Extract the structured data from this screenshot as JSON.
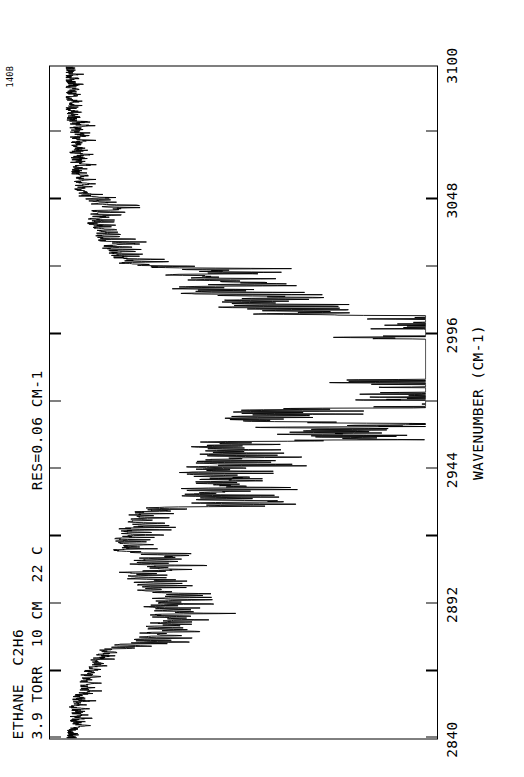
{
  "figure": {
    "corner_code": "140B",
    "header_line1": "ETHANE  C2H6",
    "header_line2": "3.9 TORR  10 CM  22 C      RES=0.06 CM-1"
  },
  "axis": {
    "title": "WAVENUMBER (CM-1)",
    "tick_labels": [
      "2840",
      "2892",
      "2944",
      "2996",
      "3048",
      "3100"
    ],
    "minor_ticks_per_interval": 1
  },
  "chart_data": {
    "type": "line",
    "title": "ETHANE  C2H6",
    "subtitle": "3.9 TORR  10 CM  22 C      RES=0.06 CM-1",
    "plate_code": "140B",
    "xlabel": "WAVENUMBER (CM-1)",
    "ylabel": "TRANSMITTANCE",
    "xlim": [
      2840,
      3100
    ],
    "ylim": [
      0,
      1
    ],
    "xticks": [
      2840,
      2892,
      2944,
      2996,
      3048,
      3100
    ],
    "grid": false,
    "legend": false,
    "orientation": "rotated-90-ccw",
    "bands": [
      {
        "center": 2896,
        "label": "nu8 / nu5 region",
        "depth": 0.42
      },
      {
        "center": 2954,
        "label": "nu7 P-branch",
        "depth": 0.55
      },
      {
        "center": 2985,
        "label": "nu7 Q-branch",
        "depth": 0.92
      },
      {
        "center": 3000,
        "label": "nu7 R-branch",
        "depth": 0.8
      },
      {
        "center": 3030,
        "label": "band tail",
        "depth": 0.3
      }
    ],
    "baseline": {
      "at_2840": 0.96,
      "at_3100": 0.99
    },
    "x": [
      2840,
      2845,
      2850,
      2855,
      2860,
      2865,
      2870,
      2875,
      2880,
      2885,
      2890,
      2895,
      2900,
      2905,
      2910,
      2915,
      2920,
      2925,
      2930,
      2935,
      2940,
      2945,
      2950,
      2955,
      2960,
      2965,
      2970,
      2975,
      2980,
      2985,
      2990,
      2995,
      3000,
      3005,
      3010,
      3015,
      3020,
      3025,
      3030,
      3035,
      3040,
      3045,
      3050,
      3055,
      3060,
      3065,
      3070,
      3075,
      3080,
      3085,
      3090,
      3095,
      3100
    ],
    "envelope": [
      0.97,
      0.96,
      0.96,
      0.95,
      0.93,
      0.9,
      0.86,
      0.8,
      0.72,
      0.66,
      0.62,
      0.66,
      0.72,
      0.76,
      0.78,
      0.77,
      0.74,
      0.7,
      0.66,
      0.62,
      0.58,
      0.52,
      0.46,
      0.42,
      0.4,
      0.38,
      0.35,
      0.32,
      0.28,
      0.22,
      0.2,
      0.24,
      0.3,
      0.38,
      0.48,
      0.58,
      0.68,
      0.76,
      0.82,
      0.86,
      0.89,
      0.91,
      0.93,
      0.94,
      0.95,
      0.955,
      0.96,
      0.965,
      0.97,
      0.972,
      0.975,
      0.978,
      0.98
    ]
  }
}
